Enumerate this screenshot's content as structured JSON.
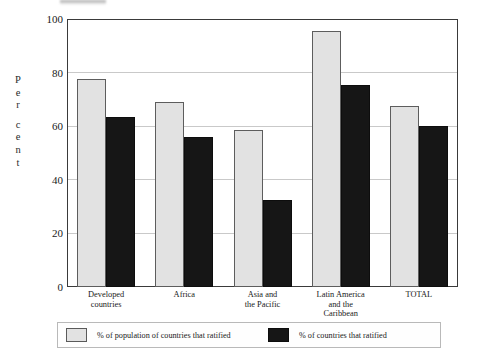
{
  "chart_data": {
    "type": "bar",
    "title": "",
    "subtitle": "",
    "xlabel": "",
    "ylabel": "Per cent",
    "ylabel_letters": [
      "P",
      "e",
      "r",
      "",
      "c",
      "e",
      "n",
      "t"
    ],
    "ylim": [
      0,
      100
    ],
    "yticks": [
      0,
      20,
      40,
      60,
      80,
      100
    ],
    "ytick_labels": [
      "0",
      "20",
      "40",
      "60",
      "80",
      "100"
    ],
    "grid": true,
    "grid_axis": "y",
    "legend_position": "bottom",
    "categories": [
      "Developed countries",
      "Africa",
      "Asia and the Pacific",
      "Latin America and the Caribbean",
      "TOTAL"
    ],
    "category_lines": [
      [
        "Developed",
        "countries"
      ],
      [
        "Africa"
      ],
      [
        "Asia and",
        "the Pacific"
      ],
      [
        "Latin America",
        "and the",
        "Caribbean"
      ],
      [
        "TOTAL"
      ]
    ],
    "series": [
      {
        "name": "% of population of countries that ratified",
        "color": "#e2e2e2",
        "values": [
          77.5,
          69,
          58.5,
          95.5,
          67.5
        ]
      },
      {
        "name": "% of countries that ratified",
        "color": "#161616",
        "values": [
          63.5,
          56,
          32.5,
          75.5,
          60
        ]
      }
    ]
  },
  "legend": {
    "items": [
      {
        "label": "% of population of countries that ratified",
        "swatch": "light"
      },
      {
        "label": "% of countries that ratified",
        "swatch": "dark"
      }
    ]
  },
  "colors": {
    "series_light": "#e2e2e2",
    "series_dark": "#161616",
    "axis": "#3a3a3a",
    "grid": "#c9c9c9",
    "background": "#ffffff"
  }
}
